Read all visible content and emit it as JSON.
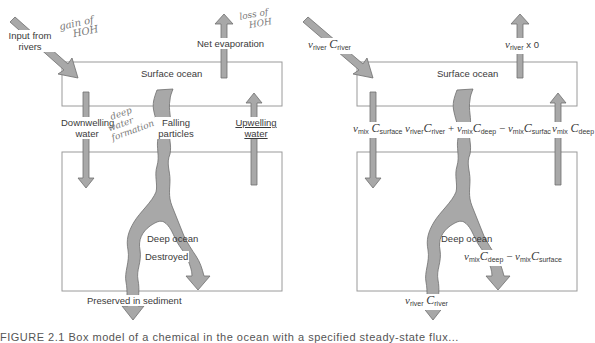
{
  "colors": {
    "arrow_fill": "#a8a8a8",
    "arrow_stroke": "#6e6e6e",
    "box_stroke": "#9a9a9a",
    "text": "#3a3a3a",
    "handwriting": "#7a7a7a"
  },
  "left_panel": {
    "boxes": {
      "surface": "Surface ocean",
      "deep": "Deep ocean"
    },
    "labels": {
      "input_rivers": "Input from rivers",
      "net_evaporation": "Net evaporation",
      "downwelling": "Downwelling water",
      "falling_particles": "Falling particles",
      "upwelling": "Upwelling water",
      "destroyed": "Destroyed",
      "preserved": "Preserved in sediment"
    },
    "handwritten_notes": {
      "gain": [
        "gain of",
        "HOH"
      ],
      "loss": [
        "loss of",
        "HOH"
      ],
      "deep_water": [
        "deep",
        "water",
        "formation"
      ]
    }
  },
  "right_panel": {
    "boxes": {
      "surface": "Surface ocean",
      "deep": "Deep ocean"
    },
    "equations": {
      "input": {
        "v": "v",
        "v_sub": "river",
        "c": "C",
        "c_sub": "river"
      },
      "evaporation": {
        "v": "v",
        "v_sub": "river",
        "rest": "x 0"
      },
      "downwelling": {
        "v": "v",
        "v_sub": "mix",
        "c": "C",
        "c_sub": "surface"
      },
      "falling": {
        "t1_v_sub": "river",
        "t1_c_sub": "river",
        "op1": "+",
        "t2_v_sub": "mix",
        "t2_c_sub": "deep",
        "op2": "−",
        "t3_v_sub": "mix",
        "t3_c_sub": "surface"
      },
      "upwelling": {
        "v": "v",
        "v_sub": "mix",
        "c": "C",
        "c_sub": "deep"
      },
      "destroyed": {
        "t1_v_sub": "mix",
        "t1_c_sub": "deep",
        "op": "−",
        "t2_v_sub": "mix",
        "t2_c_sub": "surface"
      },
      "preserved": {
        "v": "v",
        "v_sub": "river",
        "c": "C",
        "c_sub": "river"
      }
    }
  },
  "caption": "FIGURE 2.1   Box model of a chemical in the ocean with a specified steady-state flux..."
}
